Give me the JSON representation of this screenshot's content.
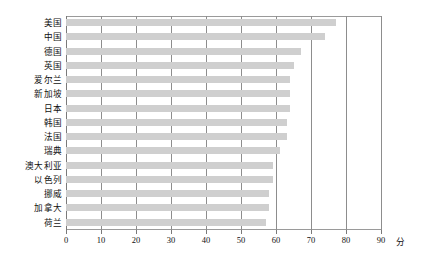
{
  "chart_data": {
    "type": "bar",
    "orientation": "horizontal",
    "title": "",
    "xlabel": "分",
    "ylabel": "",
    "xlim": [
      0,
      90
    ],
    "grid": true,
    "legend": null,
    "bar_color": "#cfcfcf",
    "categories": [
      "美国",
      "中国",
      "德国",
      "英国",
      "爱尔兰",
      "新加坡",
      "日本",
      "韩国",
      "法国",
      "瑞典",
      "澳大利亚",
      "以色列",
      "挪威",
      "加拿大",
      "荷兰"
    ],
    "values": [
      77,
      74,
      67,
      65,
      64,
      64,
      64,
      63,
      63,
      61,
      59,
      59,
      58,
      58,
      57
    ],
    "xticks": [
      0,
      10,
      20,
      30,
      40,
      50,
      60,
      70,
      80,
      90
    ],
    "xticklabels": [
      "0",
      "10",
      "20",
      "30",
      "40",
      "50",
      "60",
      "70",
      "80",
      "90"
    ]
  }
}
